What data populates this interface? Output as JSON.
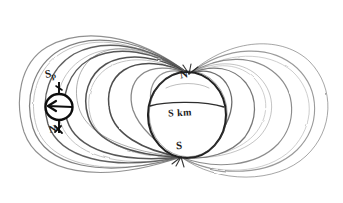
{
  "figure": {
    "domain": "diagram",
    "medium": "hand-drawn pencil sketch",
    "background_color": "#ffffff",
    "ink_color": "#2b2b2b",
    "ink_color_light": "#6e6e6e",
    "canvas": {
      "width": 343,
      "height": 203
    }
  },
  "labels": {
    "north_pole": "N",
    "south_pole": "S",
    "earth_body": "S km",
    "compass_top": "S",
    "compass_top_sub": "p",
    "compass_bottom": "N"
  },
  "earth": {
    "center_x": 187,
    "center_y": 115,
    "radius_x": 39,
    "radius_y": 43,
    "equator": true
  },
  "compass": {
    "center_x": 59,
    "center_y": 107,
    "radius": 13,
    "needle_direction": "left",
    "has_axis_line": true
  },
  "field_lines": {
    "north_pole_point": {
      "x": 189,
      "y": 74
    },
    "south_pole_point": {
      "x": 181,
      "y": 157
    },
    "left_loop_count": 7,
    "right_loop_count": 5,
    "left_extent_x": 22,
    "right_extent_x": 322,
    "top_extent_y": 31,
    "bottom_extent_y": 188
  }
}
